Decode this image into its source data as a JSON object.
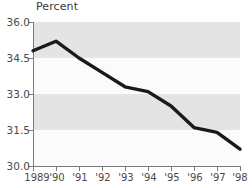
{
  "chart_data": {
    "type": "line",
    "title": "",
    "ylabel": "Percent",
    "xlabel": "",
    "ylim": [
      30.0,
      36.0
    ],
    "yticks": [
      36.0,
      34.5,
      33.0,
      31.5,
      30.0
    ],
    "ytick_labels": [
      "36.0",
      "34.5",
      "33.0",
      "31.5",
      "30.0"
    ],
    "grid": false,
    "banded_background": true,
    "legend": "none",
    "x": [
      1989,
      1990,
      1991,
      1992,
      1993,
      1994,
      1995,
      1996,
      1997,
      1998
    ],
    "xtick_labels": [
      "1989",
      "'90",
      "'91",
      "'92",
      "'93",
      "'94",
      "'95",
      "'96",
      "'97",
      "'98"
    ],
    "categories": [
      "1989",
      "'90",
      "'91",
      "'92",
      "'93",
      "'94",
      "'95",
      "'96",
      "'97",
      "'98"
    ],
    "values": [
      34.8,
      35.2,
      34.5,
      33.9,
      33.3,
      33.1,
      32.5,
      31.6,
      31.4,
      30.7
    ],
    "series": [
      {
        "name": "Percent",
        "values": [
          34.8,
          35.2,
          34.5,
          33.9,
          33.3,
          33.1,
          32.5,
          31.6,
          31.4,
          30.7
        ]
      }
    ]
  },
  "colors": {
    "line": "#1a1a1a",
    "axis": "#7a7a7a",
    "band": "#e4e4e4",
    "background": "#ffffff",
    "text": "#4a4a4a"
  }
}
